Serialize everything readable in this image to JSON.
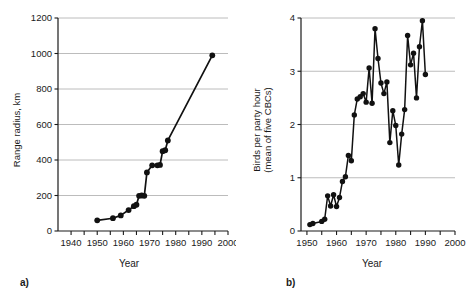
{
  "figure": {
    "panels": [
      {
        "tag": "a)",
        "xlabel": "Year",
        "ylabel": "Range radius, km"
      },
      {
        "tag": "b)",
        "xlabel": "Year",
        "ylabel_line1": "Birds per party hour",
        "ylabel_line2": "(mean of five CBCs)"
      }
    ],
    "colors": {
      "marker": "#111111",
      "line": "#111111",
      "grid": "#b4b4b4",
      "axis": "#1a1a1a",
      "background": "#ffffff"
    }
  },
  "chart_data": [
    {
      "type": "line",
      "panel": "a)",
      "title": "",
      "xlabel": "Year",
      "ylabel": "Range radius, km",
      "xlim": [
        1935,
        2000
      ],
      "ylim": [
        0,
        1200
      ],
      "xticks": [
        1940,
        1945,
        1950,
        1955,
        1960,
        1965,
        1970,
        1975,
        1980,
        1985,
        1990,
        1995,
        2000
      ],
      "xtick_labels": [
        "1940",
        "",
        "1950",
        "",
        "1960",
        "",
        "1970",
        "",
        "1980",
        "",
        "1990",
        "",
        "2000"
      ],
      "yticks": [
        0,
        200,
        400,
        600,
        800,
        1000,
        1200
      ],
      "ytick_labels": [
        "0",
        "200",
        "400",
        "600",
        "800",
        "1000",
        "1200"
      ],
      "grid": "horizontal",
      "legend": "none",
      "markers": "filled-circle",
      "x": [
        1950,
        1956,
        1959,
        1962,
        1964,
        1965,
        1966,
        1967,
        1968,
        1969,
        1971,
        1973,
        1974,
        1975,
        1976,
        1977,
        1994
      ],
      "values": [
        60,
        72,
        88,
        118,
        140,
        148,
        198,
        200,
        198,
        330,
        370,
        370,
        372,
        450,
        455,
        510,
        990
      ]
    },
    {
      "type": "line",
      "panel": "b)",
      "title": "",
      "xlabel": "Year",
      "ylabel": "Birds per party hour (mean of five CBCs)",
      "xlim": [
        1948,
        2000
      ],
      "ylim": [
        0,
        4
      ],
      "xticks": [
        1950,
        1955,
        1960,
        1965,
        1970,
        1975,
        1980,
        1985,
        1990,
        1995,
        2000
      ],
      "xtick_labels": [
        "1950",
        "",
        "1960",
        "",
        "1970",
        "",
        "1980",
        "",
        "1990",
        "",
        "2000"
      ],
      "yticks": [
        0,
        1,
        2,
        3,
        4
      ],
      "ytick_labels": [
        "0",
        "1",
        "2",
        "3",
        "4"
      ],
      "grid": "horizontal",
      "legend": "none",
      "markers": "filled-circle",
      "x": [
        1951,
        1952,
        1955,
        1956,
        1957,
        1958,
        1959,
        1960,
        1961,
        1962,
        1963,
        1964,
        1965,
        1966,
        1967,
        1968,
        1969,
        1970,
        1971,
        1972,
        1973,
        1974,
        1975,
        1976,
        1977,
        1978,
        1979,
        1980,
        1981,
        1982,
        1983,
        1984,
        1985,
        1986,
        1987,
        1988,
        1989,
        1990
      ],
      "values": [
        0.12,
        0.14,
        0.18,
        0.22,
        0.66,
        0.47,
        0.68,
        0.46,
        0.63,
        0.93,
        1.02,
        1.42,
        1.32,
        2.18,
        2.48,
        2.52,
        2.58,
        2.42,
        3.06,
        2.4,
        3.8,
        3.24,
        2.78,
        2.58,
        2.8,
        1.66,
        2.26,
        1.98,
        1.24,
        1.82,
        2.28,
        3.67,
        3.12,
        3.34,
        2.5,
        3.46,
        3.95,
        2.94
      ]
    }
  ]
}
